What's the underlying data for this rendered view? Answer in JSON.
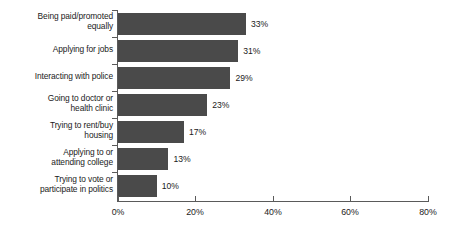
{
  "chart_data": {
    "type": "bar",
    "orientation": "horizontal",
    "title": "",
    "xlabel": "",
    "ylabel": "",
    "xlim": [
      0,
      80
    ],
    "grid": false,
    "legend": false,
    "bar_color": "#4a4a4a",
    "axis_color": "#5a5a5a",
    "text_color": "#1b1b1b",
    "background": "#ffffff",
    "categories": [
      "Being paid/promoted\nequally",
      "Applying for jobs",
      "Interacting with police",
      "Going to doctor or\nhealth clinic",
      "Trying to rent/buy\nhousing",
      "Applying to or\nattending college",
      "Trying to vote or\nparticipate in politics"
    ],
    "values": [
      33,
      31,
      29,
      23,
      17,
      13,
      10
    ],
    "value_labels": [
      "33%",
      "31%",
      "29%",
      "23%",
      "17%",
      "13%",
      "10%"
    ],
    "xticks": [
      0,
      20,
      40,
      60,
      80
    ],
    "xtick_labels": [
      "0%",
      "20%",
      "40%",
      "60%",
      "80%"
    ]
  }
}
